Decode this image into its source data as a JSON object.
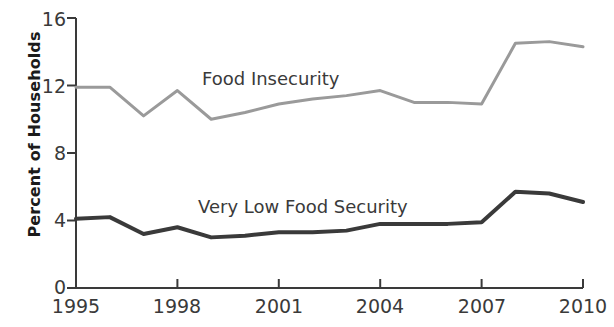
{
  "chart_data": {
    "type": "line",
    "title": "",
    "xlabel": "",
    "ylabel": "Percent of Households",
    "xlim": [
      1995,
      2010
    ],
    "ylim": [
      0,
      16
    ],
    "ytick_labels": [
      "0",
      "4",
      "8",
      "12",
      "16"
    ],
    "yticks": [
      0,
      4,
      8,
      12,
      16
    ],
    "xtick_labels": [
      "1995",
      "1998",
      "2001",
      "2004",
      "2007",
      "2010"
    ],
    "xticks": [
      1995,
      1998,
      2001,
      2004,
      2007,
      2010
    ],
    "grid": false,
    "legend_position": "inline-annotations",
    "x": [
      1995,
      1996,
      1997,
      1998,
      1999,
      2000,
      2001,
      2002,
      2003,
      2004,
      2005,
      2006,
      2007,
      2008,
      2009,
      2010
    ],
    "series": [
      {
        "name": "Food Insecurity",
        "color": "#9a9a9a",
        "values": [
          11.9,
          11.9,
          10.2,
          11.7,
          10.0,
          10.4,
          10.9,
          11.2,
          11.4,
          11.7,
          11.0,
          11.0,
          10.9,
          14.5,
          14.6,
          14.3
        ]
      },
      {
        "name": "Very Low Food Security",
        "color": "#3a3a3a",
        "values": [
          4.1,
          4.2,
          3.2,
          3.6,
          3.0,
          3.1,
          3.3,
          3.3,
          3.4,
          3.8,
          3.8,
          3.8,
          3.9,
          5.7,
          5.6,
          5.1
        ]
      }
    ],
    "annotations": [
      {
        "name": "food-insecurity",
        "text": "Food Insecurity",
        "x_px": 202,
        "y_px": 68
      },
      {
        "name": "very-low-food-security",
        "text": "Very Low Food Security",
        "x_px": 198,
        "y_px": 196
      }
    ]
  },
  "axis": {
    "y_title": "Percent of Households"
  }
}
